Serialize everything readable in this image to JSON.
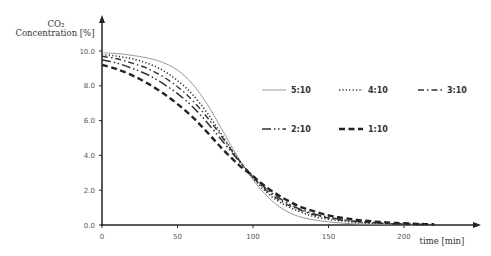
{
  "chart_data": {
    "type": "line",
    "title": "",
    "ylabel_line1": "CO₂",
    "ylabel_line2": "Concentration [%]",
    "xlabel": "time [min]",
    "xlim": [
      0,
      250
    ],
    "ylim": [
      0,
      10
    ],
    "x_ticks": [
      0,
      50,
      100,
      150,
      200
    ],
    "x_tick_labels": [
      "0",
      "50",
      "100",
      "150",
      "200"
    ],
    "y_ticks": [
      0,
      2,
      4,
      6,
      8,
      10
    ],
    "y_tick_labels": [
      "0.0",
      "2.0",
      "4.0",
      "6.0",
      "8.0",
      "10.0"
    ],
    "grid": false,
    "legend_position": "upper right (inside plot)",
    "x": [
      0,
      10,
      20,
      30,
      40,
      50,
      60,
      70,
      80,
      90,
      100,
      110,
      120,
      130,
      140,
      150,
      160,
      170,
      180,
      190,
      200,
      210,
      220
    ],
    "series": [
      {
        "name": "5:10",
        "style": "solid-thin",
        "values": [
          9.9,
          9.85,
          9.75,
          9.6,
          9.35,
          8.9,
          8.1,
          6.9,
          5.4,
          3.9,
          2.6,
          1.6,
          0.9,
          0.5,
          0.3,
          0.18,
          0.1,
          0.06,
          0.04,
          0.02,
          0.01,
          0.0,
          0.0
        ]
      },
      {
        "name": "4:10",
        "style": "dotted",
        "values": [
          9.8,
          9.7,
          9.55,
          9.3,
          8.9,
          8.3,
          7.5,
          6.4,
          5.1,
          3.8,
          2.7,
          1.8,
          1.2,
          0.8,
          0.5,
          0.33,
          0.22,
          0.14,
          0.09,
          0.06,
          0.04,
          0.02,
          0.01
        ]
      },
      {
        "name": "3:10",
        "style": "dash-dot",
        "values": [
          9.7,
          9.55,
          9.3,
          9.0,
          8.55,
          7.95,
          7.15,
          6.15,
          5.0,
          3.8,
          2.75,
          1.9,
          1.3,
          0.9,
          0.6,
          0.4,
          0.27,
          0.18,
          0.12,
          0.08,
          0.05,
          0.03,
          0.02
        ]
      },
      {
        "name": "2:10",
        "style": "long-dash-dot-dot",
        "values": [
          9.5,
          9.3,
          9.0,
          8.65,
          8.15,
          7.55,
          6.8,
          5.85,
          4.8,
          3.75,
          2.8,
          2.0,
          1.4,
          0.95,
          0.65,
          0.45,
          0.3,
          0.2,
          0.14,
          0.09,
          0.06,
          0.04,
          0.02
        ]
      },
      {
        "name": "1:10",
        "style": "dashed-thick",
        "values": [
          9.2,
          8.95,
          8.6,
          8.15,
          7.6,
          6.95,
          6.2,
          5.3,
          4.35,
          3.5,
          2.8,
          2.1,
          1.55,
          1.1,
          0.8,
          0.55,
          0.4,
          0.28,
          0.2,
          0.14,
          0.1,
          0.06,
          0.04
        ]
      }
    ]
  },
  "legend": {
    "items": [
      {
        "label": "5:10",
        "style": "solid-thin"
      },
      {
        "label": "4:10",
        "style": "dotted"
      },
      {
        "label": "3:10",
        "style": "dash-dot"
      },
      {
        "label": "2:10",
        "style": "long-dash-dot-dot"
      },
      {
        "label": "1:10",
        "style": "dashed-thick"
      }
    ]
  }
}
